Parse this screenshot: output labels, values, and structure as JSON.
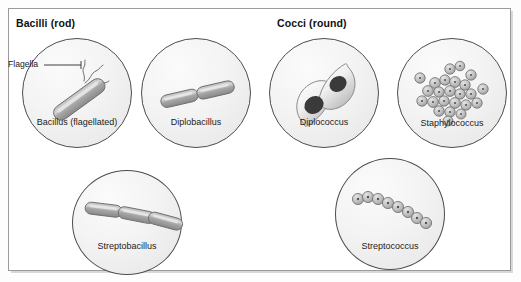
{
  "figure": {
    "background_color": "#ffffff",
    "frame_color": "#9a9a9a"
  },
  "groups": [
    {
      "id": "bacilli",
      "heading": "Bacilli (rod)"
    },
    {
      "id": "cocci",
      "heading": "Cocci (round)"
    }
  ],
  "panels": [
    {
      "id": "bacillus",
      "label": "Bacillus (flagellated)",
      "group": "bacilli",
      "shape": "single-rod-with-flagella",
      "cell_count": 1,
      "callout": {
        "text": "Flagella",
        "target": "flagella-tuft"
      }
    },
    {
      "id": "diplobacillus",
      "label": "Diplobacillus",
      "group": "bacilli",
      "shape": "two-rods-end-to-end",
      "cell_count": 2
    },
    {
      "id": "streptobacillus",
      "label": "Streptobacillus",
      "group": "bacilli",
      "shape": "chain-of-rods",
      "cell_count": 3
    },
    {
      "id": "diplococcus",
      "label": "Diplococcus",
      "group": "cocci",
      "shape": "two-joined-lens-cells-with-nuclei",
      "cell_count": 2
    },
    {
      "id": "staphylococcus",
      "label": "Staphylococcus",
      "group": "cocci",
      "shape": "irregular-grape-like-cluster",
      "cell_count": 24
    },
    {
      "id": "streptococcus",
      "label": "Streptococcus",
      "group": "cocci",
      "shape": "chain-of-cocci",
      "cell_count": 8
    }
  ],
  "colors": {
    "dish_fill": "#f2f2f2",
    "dish_stroke": "#4c4c4c",
    "cell_gray": "#9e9e9e",
    "cell_stroke": "#6d6d6d",
    "nucleus": "#3a3a3a",
    "text": "#1b1b1b"
  }
}
